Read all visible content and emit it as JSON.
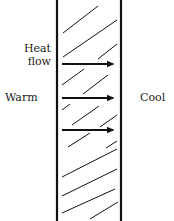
{
  "diagram": {
    "labels": {
      "heat_flow_line1": "Heat",
      "heat_flow_line2": "flow",
      "warm": "Warm",
      "cool": "Cool"
    },
    "wall": {
      "left_x": 57,
      "right_x": 121,
      "top_y": 0,
      "bottom_y": 221,
      "stroke": "#111111",
      "stroke_width": 2.2
    },
    "arrows": [
      {
        "y": 64,
        "x1": 62,
        "x2": 117
      },
      {
        "y": 98,
        "x1": 62,
        "x2": 117
      },
      {
        "y": 130,
        "x1": 62,
        "x2": 117
      }
    ],
    "hatch_lines": [
      [
        63,
        33,
        98,
        6
      ],
      [
        63,
        57,
        117,
        20
      ],
      [
        98,
        59,
        117,
        44
      ],
      [
        62,
        85,
        84,
        69
      ],
      [
        83,
        94,
        108,
        75
      ],
      [
        62,
        110,
        70,
        104
      ],
      [
        72,
        125,
        99,
        106
      ],
      [
        100,
        127,
        117,
        115
      ],
      [
        68,
        147,
        90,
        133
      ],
      [
        106,
        148,
        117,
        141
      ],
      [
        62,
        177,
        117,
        149
      ],
      [
        62,
        196,
        117,
        169
      ],
      [
        62,
        213,
        115,
        189
      ],
      [
        90,
        219,
        118,
        202
      ]
    ],
    "colors": {
      "ink": "#111111",
      "background": "#ffffff"
    }
  }
}
